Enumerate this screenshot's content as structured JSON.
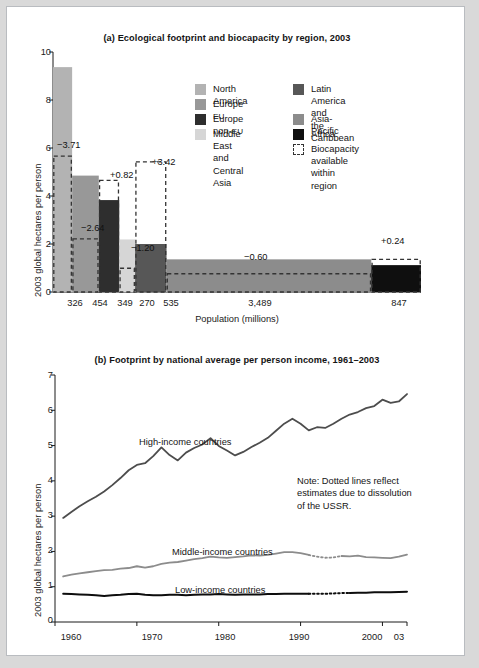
{
  "figure": {
    "background": "#ffffff",
    "page_background": "#d9d9d9"
  },
  "chart_data": [
    {
      "id": "panel-a",
      "type": "bar",
      "title": "(a) Ecological footprint and biocapacity by region, 2003",
      "xlabel": "Population (millions)",
      "ylabel": "2003 global hectares per person",
      "ylim": [
        0,
        10
      ],
      "yticks": [
        0,
        2,
        4,
        6,
        8,
        10
      ],
      "ytick_labels": [
        "0",
        "2",
        "4",
        "6",
        "8",
        "10"
      ],
      "grid": false,
      "xaxis_note": "Bar width is proportional to region population (millions)",
      "categories": [
        "North America",
        "Europe EU",
        "Europe non-EU",
        "Middle East and Central Asia",
        "Latin America and the Caribbean",
        "Asia-Pacific",
        "Africa"
      ],
      "population_millions": [
        326,
        454,
        349,
        270,
        535,
        3489,
        847
      ],
      "population_labels": [
        "326",
        "454",
        "349",
        "270",
        "535",
        "3,489",
        "847"
      ],
      "footprint_values": [
        9.37,
        4.85,
        3.83,
        2.19,
        2.0,
        1.36,
        1.12
      ],
      "biocapacity_values": [
        5.66,
        2.21,
        4.65,
        0.99,
        5.42,
        0.76,
        1.36
      ],
      "delta_labels": [
        "−3.71",
        "−2.64",
        "+0.82",
        "−1.20",
        "+3.42",
        "−0.60",
        "+0.24"
      ],
      "delta_values": [
        -3.71,
        -2.64,
        0.82,
        -1.2,
        3.42,
        -0.6,
        0.24
      ],
      "bar_colors": [
        "#b3b3b3",
        "#989898",
        "#2e2e2e",
        "#d6d6d6",
        "#575757",
        "#8c8c8c",
        "#0f0f0f"
      ],
      "legend": {
        "position": "upper-center-right",
        "column1": [
          {
            "label": "North America",
            "color": "#b3b3b3"
          },
          {
            "label": "Europe EU",
            "color": "#989898"
          },
          {
            "label": "Europe non-EU",
            "color": "#2e2e2e"
          },
          {
            "label": "Middle East and\nCentral Asia",
            "color": "#d6d6d6"
          }
        ],
        "column2": [
          {
            "label": "Latin America and\nthe Caribbean",
            "color": "#575757"
          },
          {
            "label": "Asia-Pacific",
            "color": "#8c8c8c"
          },
          {
            "label": "Africa",
            "color": "#0f0f0f"
          },
          {
            "label": "Biocapacity\navailable\nwithin region",
            "color": "dashed-outline"
          }
        ]
      }
    },
    {
      "id": "panel-b",
      "type": "line",
      "title": "(b) Footprint by national average per person income, 1961–2003",
      "xlabel": "",
      "ylabel": "2003 global hectares per person",
      "ylim": [
        0,
        7
      ],
      "yticks": [
        0,
        1,
        2,
        3,
        4,
        5,
        6,
        7
      ],
      "ytick_labels": [
        "0",
        "1",
        "2",
        "3",
        "4",
        "5",
        "6",
        "7"
      ],
      "xlim": [
        1960,
        2003
      ],
      "xticks": [
        1960,
        1970,
        1980,
        1990,
        2000,
        2003
      ],
      "xtick_labels": [
        "1960",
        "1970",
        "1980",
        "1990",
        "2000",
        "03"
      ],
      "grid": false,
      "note": "Note: Dotted lines reflect\nestimates due to dissolution\nof the USSR.",
      "x": [
        1961,
        1962,
        1963,
        1964,
        1965,
        1966,
        1967,
        1968,
        1969,
        1970,
        1971,
        1972,
        1973,
        1974,
        1975,
        1976,
        1977,
        1978,
        1979,
        1980,
        1981,
        1982,
        1983,
        1984,
        1985,
        1986,
        1987,
        1988,
        1989,
        1990,
        1991,
        1992,
        1993,
        1994,
        1995,
        1996,
        1997,
        1998,
        1999,
        2000,
        2001,
        2002,
        2003
      ],
      "series": [
        {
          "name": "High-income countries",
          "color": "#4d4d4d",
          "width": 1.8,
          "label_x": 1972,
          "label_y": 5.5,
          "values": [
            2.95,
            3.12,
            3.28,
            3.42,
            3.55,
            3.7,
            3.88,
            4.08,
            4.3,
            4.45,
            4.5,
            4.7,
            4.95,
            4.73,
            4.58,
            4.8,
            4.93,
            5.03,
            5.21,
            4.99,
            4.86,
            4.72,
            4.82,
            4.96,
            5.08,
            5.22,
            5.42,
            5.62,
            5.76,
            5.62,
            5.43,
            5.52,
            5.5,
            5.62,
            5.76,
            5.88,
            5.95,
            6.06,
            6.12,
            6.3,
            6.21,
            6.25,
            6.46
          ]
        },
        {
          "name": "Middle-income countries",
          "color": "#8c8c8c",
          "width": 1.8,
          "label_x": 1978,
          "label_y": 2.22,
          "dotted_range": [
            1991,
            1994
          ],
          "values": [
            1.29,
            1.34,
            1.38,
            1.41,
            1.44,
            1.47,
            1.48,
            1.51,
            1.53,
            1.58,
            1.54,
            1.58,
            1.65,
            1.68,
            1.7,
            1.74,
            1.78,
            1.81,
            1.85,
            1.83,
            1.82,
            1.84,
            1.86,
            1.89,
            1.88,
            1.9,
            1.94,
            1.98,
            1.98,
            1.95,
            1.9,
            1.85,
            1.82,
            1.83,
            1.87,
            1.86,
            1.88,
            1.84,
            1.83,
            1.82,
            1.81,
            1.85,
            1.91
          ]
        },
        {
          "name": "Low-income countries",
          "color": "#0d0d0d",
          "width": 2.0,
          "label_x": 1975,
          "label_y": 1.08,
          "dotted_range": [
            1991,
            1995
          ],
          "values": [
            0.8,
            0.79,
            0.78,
            0.77,
            0.76,
            0.74,
            0.76,
            0.77,
            0.79,
            0.8,
            0.77,
            0.76,
            0.76,
            0.77,
            0.77,
            0.76,
            0.77,
            0.78,
            0.78,
            0.79,
            0.78,
            0.77,
            0.78,
            0.78,
            0.78,
            0.79,
            0.79,
            0.8,
            0.8,
            0.8,
            0.8,
            0.8,
            0.8,
            0.81,
            0.82,
            0.82,
            0.83,
            0.83,
            0.84,
            0.84,
            0.84,
            0.85,
            0.86
          ]
        }
      ]
    }
  ]
}
